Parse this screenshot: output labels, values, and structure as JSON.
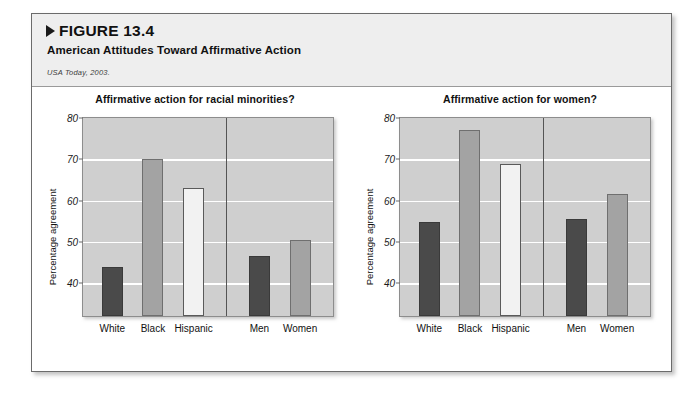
{
  "figure": {
    "number_label": "FIGURE 13.4",
    "caption": "American Attitudes Toward Affirmative Action",
    "source": "USA Today, 2003."
  },
  "chart_data": [
    {
      "type": "bar",
      "title": "Affirmative action for racial minorities?",
      "xlabel": "",
      "ylabel": "Percentage agreement",
      "ylim": [
        32,
        80
      ],
      "yticks": [
        40,
        50,
        60,
        70,
        80
      ],
      "grid": true,
      "legend": "none",
      "categories": [
        "White",
        "Black",
        "Hispanic",
        "Men",
        "Women"
      ],
      "values": [
        44,
        70,
        63,
        46.5,
        50.5
      ],
      "bar_styles": [
        "dark",
        "medium",
        "light",
        "dark",
        "medium"
      ],
      "group_divider_after": "Hispanic"
    },
    {
      "type": "bar",
      "title": "Affirmative action for women?",
      "xlabel": "",
      "ylabel": "Percentage agreement",
      "ylim": [
        32,
        80
      ],
      "yticks": [
        40,
        50,
        60,
        70,
        80
      ],
      "grid": true,
      "legend": "none",
      "categories": [
        "White",
        "Black",
        "Hispanic",
        "Men",
        "Women"
      ],
      "values": [
        54.8,
        77,
        68.8,
        55.5,
        61.5
      ],
      "bar_styles": [
        "dark",
        "medium",
        "light",
        "dark",
        "medium"
      ],
      "group_divider_after": "Hispanic"
    }
  ]
}
